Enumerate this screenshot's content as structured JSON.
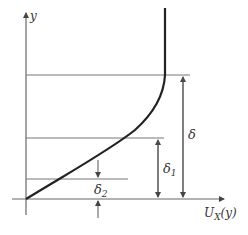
{
  "diagram": {
    "type": "boundary-layer-velocity-profile",
    "axes": {
      "y_label": "y",
      "x_label": "U",
      "x_label_sub": "X",
      "x_label_suffix": "(y)"
    },
    "dimensions": [
      {
        "name": "delta",
        "label": "δ",
        "sub": ""
      },
      {
        "name": "delta1",
        "label": "δ",
        "sub": "1"
      },
      {
        "name": "delta2",
        "label": "δ",
        "sub": "2"
      }
    ],
    "colors": {
      "axis": "#555555",
      "curve": "#222222",
      "guide": "#777777",
      "text": "#333333"
    }
  }
}
